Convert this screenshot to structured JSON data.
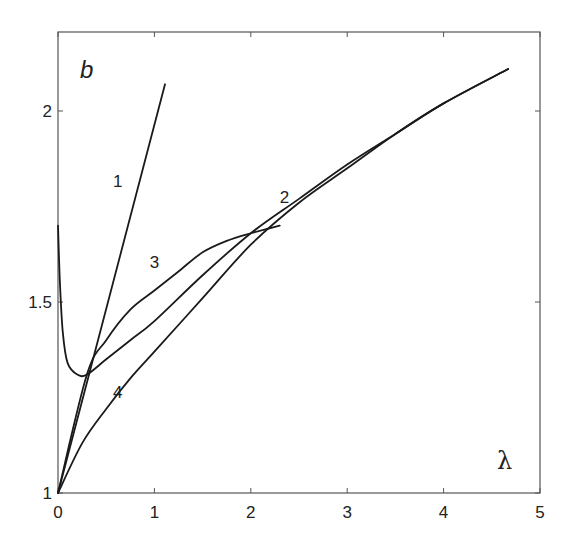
{
  "chart_data": {
    "type": "line",
    "title": "",
    "panel_label": "b",
    "xlabel": "λ",
    "ylabel": "",
    "xlim": [
      0,
      5
    ],
    "ylim": [
      1,
      2.2
    ],
    "grid": false,
    "legend": "none (inline curve labels)",
    "xticks": [
      0,
      1,
      2,
      3,
      4,
      5
    ],
    "xtick_labels": [
      "0",
      "1",
      "2",
      "3",
      "4",
      "5"
    ],
    "yticks": [
      1,
      1.5,
      2
    ],
    "ytick_labels": [
      "1",
      "1.5",
      "2"
    ],
    "series": [
      {
        "name": "1",
        "label_pos": [
          0.62,
          1.8
        ],
        "x": [
          0,
          1.11
        ],
        "y": [
          1.0,
          2.07
        ]
      },
      {
        "name": "2",
        "label_pos": [
          2.35,
          1.76
        ],
        "x": [
          0,
          0.02,
          0.05,
          0.1,
          0.2,
          0.3,
          0.5,
          0.75,
          1.0,
          1.5,
          2.0,
          2.5,
          3.0,
          3.5,
          4.0,
          4.67
        ],
        "y": [
          1.7,
          1.55,
          1.42,
          1.34,
          1.31,
          1.31,
          1.35,
          1.4,
          1.45,
          1.57,
          1.68,
          1.77,
          1.86,
          1.94,
          2.02,
          2.11
        ]
      },
      {
        "name": "3",
        "label_pos": [
          1.0,
          1.59
        ],
        "x": [
          0,
          0.3,
          0.5,
          0.75,
          1.0,
          1.25,
          1.5,
          1.75,
          2.0,
          2.3
        ],
        "y": [
          1.0,
          1.31,
          1.4,
          1.48,
          1.53,
          1.58,
          1.63,
          1.66,
          1.68,
          1.7
        ]
      },
      {
        "name": "4",
        "label_pos": [
          0.62,
          1.25
        ],
        "x": [
          0,
          0.25,
          0.5,
          0.75,
          1.0,
          1.5,
          2.0,
          2.5,
          3.0,
          3.5,
          4.0,
          4.67
        ],
        "y": [
          1.0,
          1.13,
          1.22,
          1.3,
          1.37,
          1.51,
          1.65,
          1.76,
          1.85,
          1.94,
          2.02,
          2.11
        ]
      }
    ]
  },
  "style": {
    "line_color": "#1a1a1a",
    "axis_color": "#555555",
    "background": "#ffffff"
  },
  "frame": {
    "left": 58,
    "top": 32,
    "right": 540,
    "bottom": 493,
    "x_px_per_unit": 96.4,
    "y_px_per_unit": 382
  }
}
